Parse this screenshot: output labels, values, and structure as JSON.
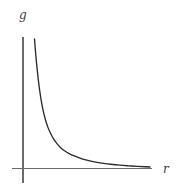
{
  "figure": {
    "title": "",
    "background_color": "#ffffff",
    "width": 187,
    "height": 191,
    "y_axis_label": "g",
    "x_axis_label": "r",
    "axis_color": "#6b6b6b",
    "curve_color": "#2b2b2b"
  },
  "chart_data": {
    "type": "line",
    "title": "",
    "subtitle": "",
    "xlabel": "r",
    "ylabel": "g",
    "legend": [],
    "legend_position": "none",
    "grid": false,
    "axis_ticks": false,
    "tick_labels_x": [],
    "tick_labels_y": [],
    "xlim": [
      0,
      1
    ],
    "ylim": [
      0,
      1
    ],
    "series": [
      {
        "name": "g(r)",
        "color": "#2b2b2b",
        "x": [
          0.085,
          0.095,
          0.105,
          0.115,
          0.125,
          0.14,
          0.155,
          0.17,
          0.19,
          0.21,
          0.235,
          0.26,
          0.29,
          0.32,
          0.36,
          0.4,
          0.45,
          0.5,
          0.56,
          0.62,
          0.69,
          0.76,
          0.83,
          0.9,
          0.96,
          1.0
        ],
        "y": [
          1.0,
          0.88,
          0.78,
          0.69,
          0.615,
          0.52,
          0.448,
          0.39,
          0.33,
          0.285,
          0.24,
          0.206,
          0.173,
          0.15,
          0.126,
          0.108,
          0.09,
          0.076,
          0.063,
          0.054,
          0.045,
          0.038,
          0.033,
          0.029,
          0.026,
          0.024
        ]
      }
    ]
  },
  "geometry": {
    "origin_x": 23,
    "origin_y": 168,
    "y_axis_top": 37,
    "y_axis_bottom": 183,
    "x_axis_left": 12,
    "x_axis_right": 152,
    "curve_start_x": 34.5,
    "curve_start_y": 39,
    "curve_end_x": 150,
    "curve_end_y": 167
  }
}
